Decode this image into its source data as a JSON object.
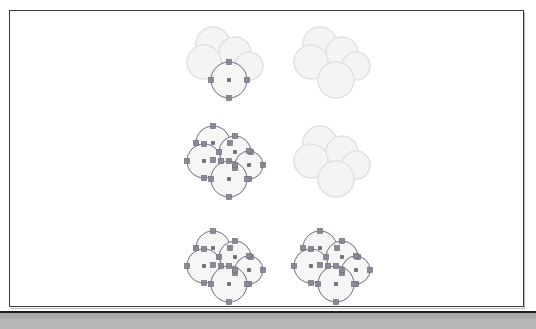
{
  "app": {
    "window_title": "Vector Canvas",
    "status_text": ""
  },
  "canvas": {
    "background_color": "#ffffff",
    "frame_border_color": "#3a3a3a",
    "width": 515,
    "height": 297
  },
  "status_bar": {
    "background_color": "#b6b6b6",
    "border_color": "#1d1d1d",
    "label": ""
  },
  "palette": {
    "shape_fill_dim": "#f4f4f4",
    "shape_stroke_dim": "#e2e2e2",
    "shape_fill_active": "#f6f6f6",
    "shape_stroke_active": "#6b6b78",
    "handle_fill": "#8a8a96",
    "handle_stroke": "#6b6b78",
    "center_dot_color": "#6b6b78"
  },
  "chart_data": {
    "type": "scatter",
    "title": "",
    "xlabel": "",
    "ylabel": "",
    "grid": false,
    "legend": "none"
  },
  "clusters": [
    {
      "id": "cluster-r1c1",
      "name": "cluster-top-left",
      "row": 1,
      "col": 1,
      "left": 184,
      "top": 24,
      "width": 86,
      "height": 78,
      "selected_count": 1,
      "total_shapes": 5,
      "shapes": [
        {
          "name": "circle-upper-left",
          "cx": 28,
          "cy": 19,
          "r": 17,
          "selected": false
        },
        {
          "name": "circle-upper-right",
          "cx": 50,
          "cy": 28,
          "r": 16,
          "selected": false
        },
        {
          "name": "circle-left",
          "cx": 19,
          "cy": 37,
          "r": 17,
          "selected": false
        },
        {
          "name": "circle-right",
          "cx": 64,
          "cy": 41,
          "r": 14,
          "selected": false
        },
        {
          "name": "circle-bottom",
          "cx": 44,
          "cy": 55,
          "r": 18,
          "selected": true
        }
      ]
    },
    {
      "id": "cluster-r1c2",
      "name": "cluster-top-right",
      "row": 1,
      "col": 2,
      "left": 291,
      "top": 24,
      "width": 86,
      "height": 78,
      "selected_count": 0,
      "total_shapes": 5,
      "shapes": [
        {
          "name": "circle-upper-left",
          "cx": 28,
          "cy": 19,
          "r": 17,
          "selected": false
        },
        {
          "name": "circle-upper-right",
          "cx": 50,
          "cy": 28,
          "r": 16,
          "selected": false
        },
        {
          "name": "circle-left",
          "cx": 19,
          "cy": 37,
          "r": 17,
          "selected": false
        },
        {
          "name": "circle-right",
          "cx": 64,
          "cy": 41,
          "r": 14,
          "selected": false
        },
        {
          "name": "circle-bottom",
          "cx": 44,
          "cy": 55,
          "r": 18,
          "selected": false
        }
      ]
    },
    {
      "id": "cluster-r2c1",
      "name": "cluster-middle-left",
      "row": 2,
      "col": 1,
      "left": 184,
      "top": 123,
      "width": 86,
      "height": 78,
      "selected_count": 5,
      "total_shapes": 5,
      "shapes": [
        {
          "name": "circle-upper-left",
          "cx": 28,
          "cy": 19,
          "r": 17,
          "selected": true
        },
        {
          "name": "circle-upper-right",
          "cx": 50,
          "cy": 28,
          "r": 16,
          "selected": true
        },
        {
          "name": "circle-left",
          "cx": 19,
          "cy": 37,
          "r": 17,
          "selected": true
        },
        {
          "name": "circle-right",
          "cx": 64,
          "cy": 41,
          "r": 14,
          "selected": true
        },
        {
          "name": "circle-bottom",
          "cx": 44,
          "cy": 55,
          "r": 18,
          "selected": true
        }
      ]
    },
    {
      "id": "cluster-r2c2",
      "name": "cluster-middle-right",
      "row": 2,
      "col": 2,
      "left": 291,
      "top": 123,
      "width": 86,
      "height": 78,
      "selected_count": 0,
      "total_shapes": 5,
      "shapes": [
        {
          "name": "circle-upper-left",
          "cx": 28,
          "cy": 19,
          "r": 17,
          "selected": false
        },
        {
          "name": "circle-upper-right",
          "cx": 50,
          "cy": 28,
          "r": 16,
          "selected": false
        },
        {
          "name": "circle-left",
          "cx": 19,
          "cy": 37,
          "r": 17,
          "selected": false
        },
        {
          "name": "circle-right",
          "cx": 64,
          "cy": 41,
          "r": 14,
          "selected": false
        },
        {
          "name": "circle-bottom",
          "cx": 44,
          "cy": 55,
          "r": 18,
          "selected": false
        }
      ]
    },
    {
      "id": "cluster-r3c1",
      "name": "cluster-bottom-left",
      "row": 3,
      "col": 1,
      "left": 184,
      "top": 228,
      "width": 86,
      "height": 78,
      "selected_count": 5,
      "total_shapes": 5,
      "shapes": [
        {
          "name": "circle-upper-left",
          "cx": 28,
          "cy": 19,
          "r": 17,
          "selected": true
        },
        {
          "name": "circle-upper-right",
          "cx": 50,
          "cy": 28,
          "r": 16,
          "selected": true
        },
        {
          "name": "circle-left",
          "cx": 19,
          "cy": 37,
          "r": 17,
          "selected": true
        },
        {
          "name": "circle-right",
          "cx": 64,
          "cy": 41,
          "r": 14,
          "selected": true
        },
        {
          "name": "circle-bottom",
          "cx": 44,
          "cy": 55,
          "r": 18,
          "selected": true
        }
      ]
    },
    {
      "id": "cluster-r3c2",
      "name": "cluster-bottom-right",
      "row": 3,
      "col": 2,
      "left": 291,
      "top": 228,
      "width": 86,
      "height": 78,
      "selected_count": 5,
      "total_shapes": 5,
      "shapes": [
        {
          "name": "circle-upper-left",
          "cx": 28,
          "cy": 19,
          "r": 17,
          "selected": true
        },
        {
          "name": "circle-upper-right",
          "cx": 50,
          "cy": 28,
          "r": 16,
          "selected": true
        },
        {
          "name": "circle-left",
          "cx": 19,
          "cy": 37,
          "r": 17,
          "selected": true
        },
        {
          "name": "circle-right",
          "cx": 64,
          "cy": 41,
          "r": 14,
          "selected": true
        },
        {
          "name": "circle-bottom",
          "cx": 44,
          "cy": 55,
          "r": 18,
          "selected": true
        }
      ]
    }
  ]
}
